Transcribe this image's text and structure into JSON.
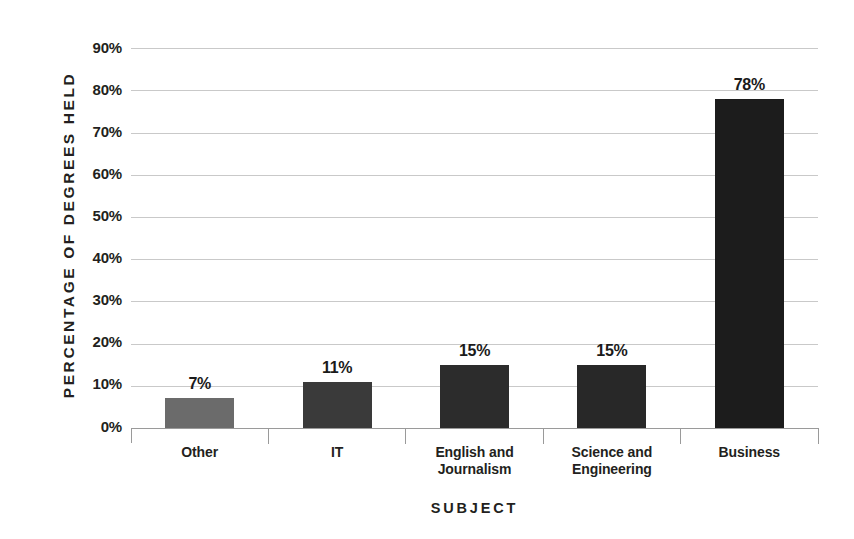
{
  "chart_data": {
    "type": "bar",
    "title": "",
    "xlabel": "SUBJECT",
    "ylabel": "PERCENTAGE OF DEGREES HELD",
    "categories": [
      "Other",
      "IT",
      "English and Journalism",
      "Science and Engineering",
      "Business"
    ],
    "values": [
      7,
      11,
      15,
      15,
      78
    ],
    "value_labels": [
      "7%",
      "11%",
      "15%",
      "15%",
      "78%"
    ],
    "ylim": [
      0,
      90
    ],
    "ytick_values": [
      0,
      10,
      20,
      30,
      40,
      50,
      60,
      70,
      80,
      90
    ],
    "ytick_labels": [
      "0%",
      "10%",
      "20%",
      "30%",
      "40%",
      "50%",
      "60%",
      "70%",
      "80%",
      "90%"
    ],
    "grid": true,
    "legend": "none",
    "bar_colors": [
      "#6b6b6b",
      "#3a3a3a",
      "#2c2c2c",
      "#282828",
      "#1c1c1c"
    ],
    "gridline_color": "#c9c9c9",
    "axis_color": "#9a9a9a",
    "text_color": "#231f20",
    "background_color": "#ffffff"
  },
  "axis": {
    "y_title": "PERCENTAGE OF DEGREES HELD",
    "x_title": "SUBJECT"
  },
  "ticks": {
    "y": [
      {
        "label": "90%"
      },
      {
        "label": "80%"
      },
      {
        "label": "70%"
      },
      {
        "label": "60%"
      },
      {
        "label": "50%"
      },
      {
        "label": "40%"
      },
      {
        "label": "30%"
      },
      {
        "label": "20%"
      },
      {
        "label": "10%"
      },
      {
        "label": "0%"
      }
    ]
  },
  "bars": [
    {
      "category": "Other",
      "category_line1": "Other",
      "category_line2": "",
      "value": 7,
      "label": "7%"
    },
    {
      "category": "IT",
      "category_line1": "IT",
      "category_line2": "",
      "value": 11,
      "label": "11%"
    },
    {
      "category": "English and Journalism",
      "category_line1": "English and",
      "category_line2": "Journalism",
      "value": 15,
      "label": "15%"
    },
    {
      "category": "Science and Engineering",
      "category_line1": "Science and",
      "category_line2": "Engineering",
      "value": 15,
      "label": "15%"
    },
    {
      "category": "Business",
      "category_line1": "Business",
      "category_line2": "",
      "value": 78,
      "label": "78%"
    }
  ]
}
